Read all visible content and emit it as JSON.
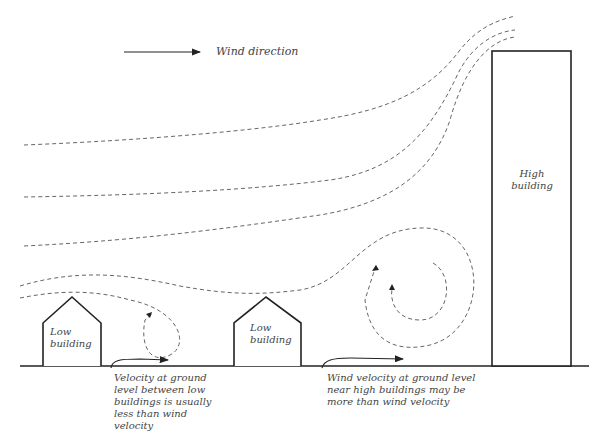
{
  "legend": {
    "label": "Wind direction",
    "icon": "arrow-right-icon"
  },
  "buildings": [
    {
      "name": "low-building-1",
      "label_line1": "Low",
      "label_line2": "building"
    },
    {
      "name": "low-building-2",
      "label_line1": "Low",
      "label_line2": "building"
    },
    {
      "name": "high-building",
      "label_line1": "High",
      "label_line2": "building"
    }
  ],
  "annotations": {
    "low": [
      "Velocity at ground",
      "level between low",
      "buildings is usually",
      "less than wind",
      "velocity"
    ],
    "high": [
      "Wind velocity at ground level",
      "near high buildings may be",
      "more than wind velocity"
    ]
  },
  "colors": {
    "line": "#222222",
    "streamline": "#666666",
    "text": "#444444",
    "background": "#ffffff"
  }
}
